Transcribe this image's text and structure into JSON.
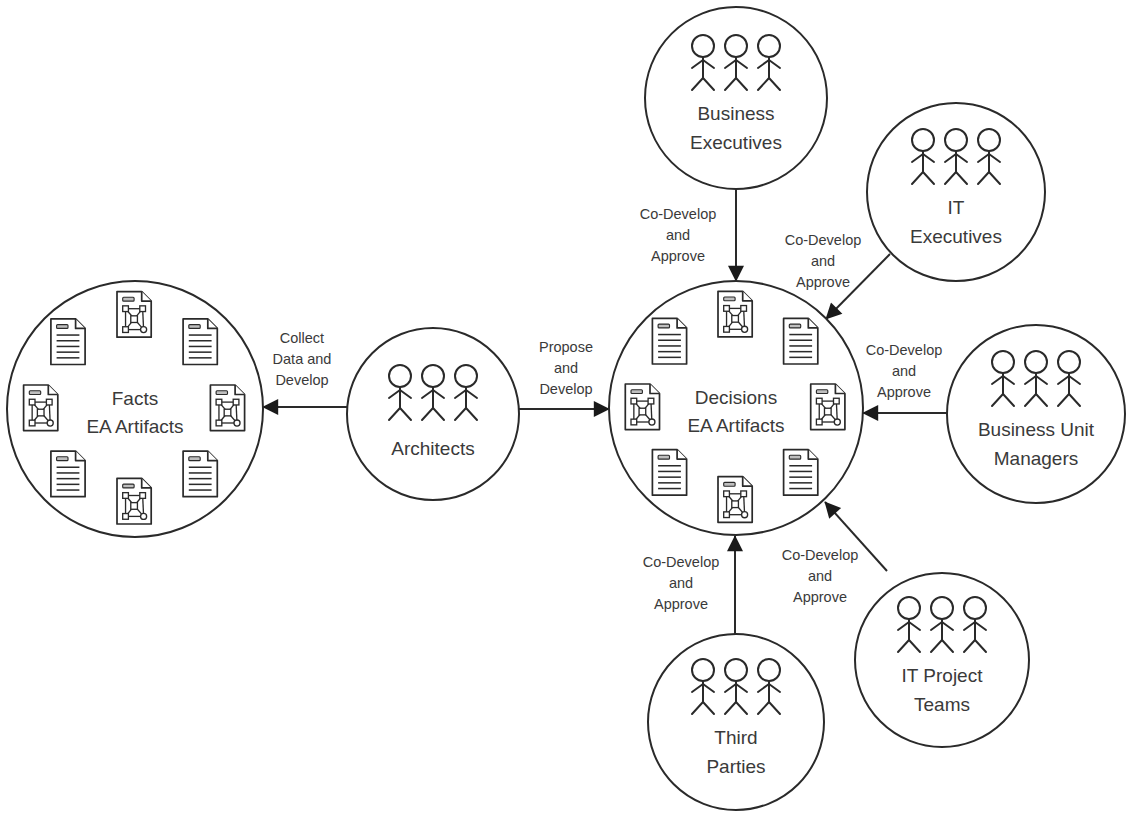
{
  "diagram": {
    "type": "stakeholder-flow",
    "colors": {
      "stroke": "#2a2a2a",
      "text": "#3a3a3a",
      "background": "#ffffff",
      "doc_tag": "#bfbfbf"
    },
    "artifact_nodes": [
      {
        "id": "facts",
        "label_lines": [
          "Facts",
          "EA Artifacts"
        ],
        "cx": 135,
        "cy": 409,
        "r": 128
      },
      {
        "id": "decisions",
        "label_lines": [
          "Decisions",
          "EA Artifacts"
        ],
        "cx": 736,
        "cy": 408,
        "r": 127
      }
    ],
    "actor_nodes": [
      {
        "id": "architects",
        "label_lines": [
          "Architects"
        ],
        "cx": 433,
        "cy": 414,
        "r": 86,
        "icon": "people-group-icon"
      },
      {
        "id": "business-executives",
        "label_lines": [
          "Business",
          "Executives"
        ],
        "cx": 736,
        "cy": 98,
        "r": 91,
        "icon": "people-group-icon"
      },
      {
        "id": "it-executives",
        "label_lines": [
          "IT",
          "Executives"
        ],
        "cx": 956,
        "cy": 192,
        "r": 89,
        "icon": "people-group-icon"
      },
      {
        "id": "business-unit-managers",
        "label_lines": [
          "Business Unit",
          "Managers"
        ],
        "cx": 1036,
        "cy": 414,
        "r": 89,
        "icon": "people-group-icon"
      },
      {
        "id": "it-project-teams",
        "label_lines": [
          "IT Project",
          "Teams"
        ],
        "cx": 942,
        "cy": 660,
        "r": 87,
        "icon": "people-group-icon"
      },
      {
        "id": "third-parties",
        "label_lines": [
          "Third",
          "Parties"
        ],
        "cx": 736,
        "cy": 722,
        "r": 88,
        "icon": "people-group-icon"
      }
    ],
    "edges": [
      {
        "from": "architects",
        "to": "facts",
        "label_lines": [
          "Collect",
          "Data and",
          "Develop"
        ],
        "x1": 347,
        "y1": 407,
        "x2": 263,
        "y2": 407,
        "lx": 302,
        "ly": 343
      },
      {
        "from": "architects",
        "to": "decisions",
        "label_lines": [
          "Propose",
          "and",
          "Develop"
        ],
        "x1": 519,
        "y1": 409,
        "x2": 609,
        "y2": 409,
        "lx": 566,
        "ly": 352
      },
      {
        "from": "business-executives",
        "to": "decisions",
        "label_lines": [
          "Co-Develop",
          "and",
          "Approve"
        ],
        "x1": 736,
        "y1": 189,
        "x2": 736,
        "y2": 281,
        "lx": 678,
        "ly": 219
      },
      {
        "from": "it-executives",
        "to": "decisions",
        "label_lines": [
          "Co-Develop",
          "and",
          "Approve"
        ],
        "x1": 890,
        "y1": 254,
        "x2": 826,
        "y2": 319,
        "lx": 823,
        "ly": 245
      },
      {
        "from": "business-unit-managers",
        "to": "decisions",
        "label_lines": [
          "Co-Develop",
          "and",
          "Approve"
        ],
        "x1": 947,
        "y1": 413,
        "x2": 863,
        "y2": 413,
        "lx": 904,
        "ly": 355
      },
      {
        "from": "it-project-teams",
        "to": "decisions",
        "label_lines": [
          "Co-Develop",
          "and",
          "Approve"
        ],
        "x1": 887,
        "y1": 571,
        "x2": 825,
        "y2": 502,
        "lx": 820,
        "ly": 560
      },
      {
        "from": "third-parties",
        "to": "decisions",
        "label_lines": [
          "Co-Develop",
          "and",
          "Approve"
        ],
        "x1": 735,
        "y1": 634,
        "x2": 735,
        "y2": 536,
        "lx": 681,
        "ly": 567
      }
    ],
    "artifact_icons": {
      "text_document": "text-document-icon",
      "network_document": "network-diagram-document-icon",
      "ring_order": [
        "network",
        "text",
        "network",
        "text",
        "network",
        "text",
        "network",
        "text"
      ]
    }
  }
}
